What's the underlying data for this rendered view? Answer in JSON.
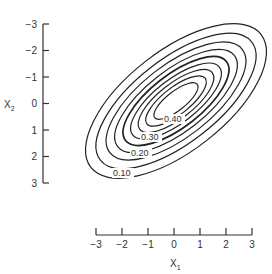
{
  "chart_data": {
    "type": "contour",
    "title": "",
    "xlabel": "X1",
    "ylabel": "X2",
    "x_ticks": [
      "-3",
      "-2",
      "-1",
      "0",
      "1",
      "2",
      "3"
    ],
    "y_ticks": [
      "-3",
      "-2",
      "-1",
      "0",
      "1",
      "2",
      "3"
    ],
    "xlim": [
      -3,
      3
    ],
    "ylim": [
      -3,
      3
    ],
    "y_axis_inverted": true,
    "grid": false,
    "contour_levels": [
      0.01,
      0.05,
      0.1,
      0.15,
      0.2,
      0.25,
      0.3,
      0.35,
      0.4
    ],
    "labeled_levels": [
      "0.10",
      "0.20",
      "0.30",
      "0.40"
    ]
  },
  "axes": {
    "xlabel_main": "X",
    "xlabel_sub": "1",
    "ylabel_main": "X",
    "ylabel_sub": "2"
  }
}
